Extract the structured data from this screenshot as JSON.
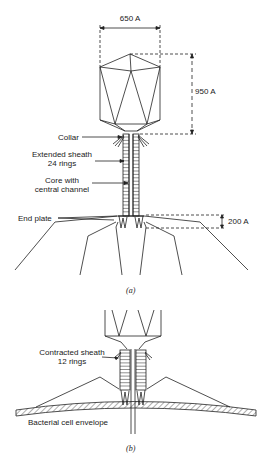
{
  "figure_a": {
    "caption": "(a)",
    "dimensions": {
      "head_width": "650 A",
      "head_height": "950 A",
      "end_plate_height": "200 A"
    },
    "labels": {
      "collar": "Collar",
      "sheath_line1": "Extended sheath",
      "sheath_line2": "24 rings",
      "core_line1": "Core with",
      "core_line2": "central channel",
      "end_plate": "End plate"
    }
  },
  "figure_b": {
    "caption": "(b)",
    "labels": {
      "sheath_line1": "Contracted sheath",
      "sheath_line2": "12 rings",
      "envelope": "Bacterial cell envelope"
    }
  }
}
